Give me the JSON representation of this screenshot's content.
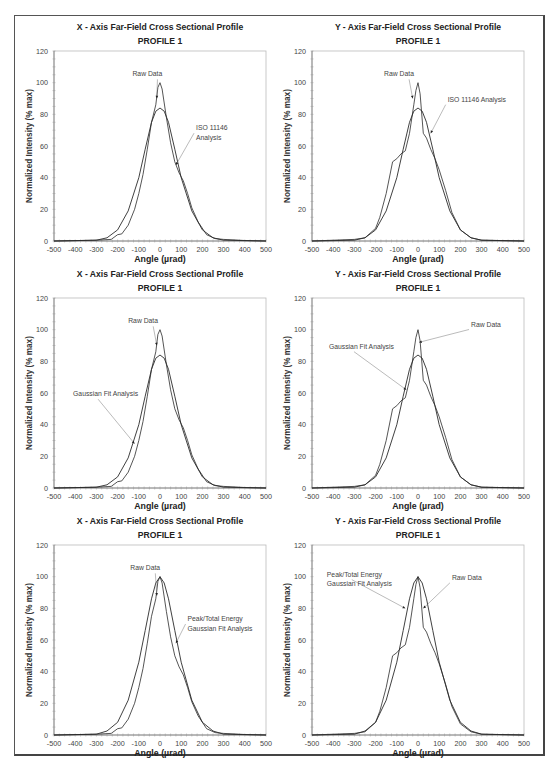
{
  "figure": {
    "panels_layout": "3 rows x 2 columns"
  },
  "chart_data": [
    {
      "id": "p1",
      "type": "line",
      "title": "X - Axis Far-Field Cross Sectional Profile",
      "subtitle": "PROFILE 1",
      "xlabel": "Angle (µrad)",
      "ylabel": "Normalized Intensity (% max)",
      "xlim": [
        -500,
        500
      ],
      "ylim": [
        0,
        120
      ],
      "xticks": [
        -500,
        -400,
        -300,
        -200,
        -100,
        0,
        100,
        200,
        300,
        400,
        500
      ],
      "yticks": [
        0,
        20,
        40,
        60,
        80,
        100,
        120
      ],
      "series": [
        {
          "name": "Raw Data",
          "x": [
            -500,
            -300,
            -230,
            -200,
            -180,
            -150,
            -120,
            -100,
            -80,
            -60,
            -40,
            -20,
            -10,
            0,
            10,
            30,
            50,
            70,
            90,
            110,
            130,
            150,
            180,
            220,
            260,
            300,
            400,
            500
          ],
          "y": [
            0,
            0.5,
            1,
            4,
            4.5,
            10,
            20,
            30,
            42,
            58,
            75,
            86,
            97,
            100,
            96,
            78,
            62,
            50,
            43,
            38,
            30,
            21,
            12,
            4,
            1.5,
            1,
            0.3,
            0
          ]
        },
        {
          "name": "ISO 11146 Analysis",
          "x": [
            -500,
            -300,
            -250,
            -200,
            -150,
            -100,
            -70,
            -40,
            -20,
            0,
            20,
            40,
            70,
            100,
            150,
            200,
            250,
            300,
            500
          ],
          "y": [
            0,
            0.5,
            2,
            7,
            19,
            40,
            58,
            75,
            82,
            84,
            82,
            75,
            58,
            40,
            19,
            7,
            2,
            0.5,
            0
          ]
        }
      ],
      "annotations": [
        {
          "text": "Raw Data",
          "x": -130,
          "y": 104,
          "arrow_to": [
            -15,
            90
          ]
        },
        {
          "text": "ISO 11146",
          "x": 170,
          "y": 70,
          "arrow_to": [
            75,
            48
          ]
        },
        {
          "text": "Analysis",
          "x": 170,
          "y": 64
        }
      ]
    },
    {
      "id": "p2",
      "type": "line",
      "title": "Y - Axis Far-Field Cross Sectional Profile",
      "subtitle": "PROFILE 1",
      "xlabel": "Angle (µrad)",
      "ylabel": "Normalized Intensity (% max)",
      "xlim": [
        -500,
        500
      ],
      "ylim": [
        0,
        120
      ],
      "xticks": [
        -500,
        -400,
        -300,
        -200,
        -100,
        0,
        100,
        200,
        300,
        400,
        500
      ],
      "yticks": [
        0,
        20,
        40,
        60,
        80,
        100,
        120
      ],
      "series": [
        {
          "name": "Raw Data",
          "x": [
            -500,
            -300,
            -250,
            -200,
            -180,
            -150,
            -120,
            -100,
            -80,
            -60,
            -40,
            -20,
            -10,
            0,
            10,
            25,
            40,
            60,
            80,
            100,
            130,
            160,
            200,
            250,
            300,
            500
          ],
          "y": [
            0,
            1,
            2,
            8,
            15,
            30,
            50,
            52,
            55,
            57,
            68,
            86,
            95,
            100,
            93,
            68,
            65,
            58,
            52,
            45,
            32,
            18,
            7,
            2,
            0.5,
            0
          ]
        },
        {
          "name": "ISO 11146 Analysis",
          "x": [
            -500,
            -300,
            -250,
            -200,
            -150,
            -100,
            -70,
            -40,
            -20,
            0,
            20,
            40,
            70,
            100,
            150,
            200,
            250,
            300,
            500
          ],
          "y": [
            0,
            0.5,
            2,
            7,
            19,
            40,
            58,
            75,
            82,
            84,
            82,
            75,
            58,
            40,
            19,
            7,
            2,
            0.5,
            0
          ]
        }
      ],
      "annotations": [
        {
          "text": "Raw Data",
          "x": -160,
          "y": 104,
          "arrow_to": [
            -25,
            90
          ]
        },
        {
          "text": "ISO 11146 Analysis",
          "x": 140,
          "y": 88,
          "arrow_to": [
            60,
            68
          ]
        }
      ]
    },
    {
      "id": "p3",
      "type": "line",
      "title": "X - Axis Far-Field Cross Sectional Profile",
      "subtitle": "PROFILE 1",
      "xlabel": "Angle (µrad)",
      "ylabel": "Normalized Intensity (% max)",
      "xlim": [
        -500,
        500
      ],
      "ylim": [
        0,
        120
      ],
      "xticks": [
        -500,
        -400,
        -300,
        -200,
        -100,
        0,
        100,
        200,
        300,
        400,
        500
      ],
      "yticks": [
        0,
        20,
        40,
        60,
        80,
        100,
        120
      ],
      "series": [
        {
          "name": "Raw Data",
          "x": [
            -500,
            -300,
            -230,
            -200,
            -180,
            -150,
            -120,
            -100,
            -80,
            -60,
            -40,
            -20,
            -10,
            0,
            10,
            30,
            50,
            70,
            90,
            110,
            130,
            150,
            180,
            220,
            260,
            300,
            400,
            500
          ],
          "y": [
            0,
            0.5,
            1,
            4,
            4.5,
            10,
            20,
            30,
            42,
            58,
            75,
            86,
            97,
            100,
            96,
            78,
            62,
            50,
            43,
            38,
            30,
            21,
            12,
            4,
            1.5,
            1,
            0.3,
            0
          ]
        },
        {
          "name": "Gaussian Fit Analysis",
          "x": [
            -500,
            -300,
            -250,
            -200,
            -150,
            -100,
            -70,
            -40,
            -20,
            0,
            20,
            40,
            70,
            100,
            150,
            200,
            250,
            300,
            500
          ],
          "y": [
            0,
            0.5,
            2,
            7,
            19,
            40,
            58,
            75,
            82,
            84,
            82,
            75,
            58,
            40,
            19,
            7,
            2,
            0.5,
            0
          ]
        }
      ],
      "annotations": [
        {
          "text": "Raw Data",
          "x": -150,
          "y": 104,
          "arrow_to": [
            -15,
            90
          ]
        },
        {
          "text": "Gaussian Fit Analysis",
          "x": -410,
          "y": 58,
          "arrow_to": [
            -120,
            28
          ]
        }
      ]
    },
    {
      "id": "p4",
      "type": "line",
      "title": "Y - Axis Far-Field Cross Sectional Profile",
      "subtitle": "PROFILE 1",
      "xlabel": "Angle (µrad)",
      "ylabel": "Normalized Intensity (% max)",
      "xlim": [
        -500,
        500
      ],
      "ylim": [
        0,
        120
      ],
      "xticks": [
        -500,
        -400,
        -300,
        -200,
        -100,
        0,
        100,
        200,
        300,
        400,
        500
      ],
      "yticks": [
        0,
        20,
        40,
        60,
        80,
        100,
        120
      ],
      "series": [
        {
          "name": "Raw Data",
          "x": [
            -500,
            -300,
            -250,
            -200,
            -180,
            -150,
            -120,
            -100,
            -80,
            -60,
            -40,
            -20,
            -10,
            0,
            10,
            25,
            40,
            60,
            80,
            100,
            130,
            160,
            200,
            250,
            300,
            500
          ],
          "y": [
            0,
            1,
            2,
            8,
            15,
            30,
            50,
            52,
            55,
            57,
            68,
            86,
            95,
            100,
            93,
            68,
            65,
            58,
            52,
            45,
            32,
            18,
            7,
            2,
            0.5,
            0
          ]
        },
        {
          "name": "Gaussian Fit Analysis",
          "x": [
            -500,
            -300,
            -250,
            -200,
            -150,
            -100,
            -70,
            -40,
            -20,
            0,
            20,
            40,
            70,
            100,
            150,
            200,
            250,
            300,
            500
          ],
          "y": [
            0,
            0.5,
            2,
            7,
            19,
            40,
            58,
            75,
            82,
            84,
            82,
            75,
            58,
            40,
            19,
            7,
            2,
            0.5,
            0
          ]
        }
      ],
      "annotations": [
        {
          "text": "Raw Data",
          "x": 250,
          "y": 102,
          "arrow_to": [
            5,
            92
          ]
        },
        {
          "text": "Gaussian Fit Analysis",
          "x": -420,
          "y": 88,
          "arrow_to": [
            -55,
            62
          ]
        }
      ]
    },
    {
      "id": "p5",
      "type": "line",
      "title": "X - Axis Far-Field Cross Sectional Profile",
      "subtitle": "PROFILE 1",
      "xlabel": "Angle (µrad)",
      "ylabel": "Normalized Intensity (% max)",
      "xlim": [
        -500,
        500
      ],
      "ylim": [
        0,
        120
      ],
      "xticks": [
        -500,
        -400,
        -300,
        -200,
        -100,
        0,
        100,
        200,
        300,
        400,
        500
      ],
      "yticks": [
        0,
        20,
        40,
        60,
        80,
        100,
        120
      ],
      "series": [
        {
          "name": "Raw Data",
          "x": [
            -500,
            -300,
            -230,
            -200,
            -180,
            -150,
            -120,
            -100,
            -80,
            -60,
            -40,
            -20,
            -10,
            0,
            10,
            30,
            50,
            70,
            90,
            110,
            130,
            150,
            180,
            220,
            260,
            300,
            400,
            500
          ],
          "y": [
            0,
            0.5,
            1,
            4,
            4.5,
            10,
            20,
            30,
            42,
            58,
            75,
            86,
            97,
            100,
            96,
            78,
            62,
            50,
            43,
            38,
            30,
            21,
            12,
            4,
            1.5,
            1,
            0.3,
            0
          ]
        },
        {
          "name": "Peak/Total Energy Gaussian Fit Analysis",
          "x": [
            -500,
            -300,
            -250,
            -200,
            -150,
            -100,
            -70,
            -40,
            -20,
            0,
            20,
            40,
            70,
            100,
            150,
            200,
            250,
            300,
            500
          ],
          "y": [
            0,
            0.5,
            2.5,
            8,
            22,
            46,
            66,
            86,
            96,
            100,
            96,
            86,
            66,
            46,
            22,
            8,
            2.5,
            0.5,
            0
          ]
        }
      ],
      "annotations": [
        {
          "text": "Raw Data",
          "x": -140,
          "y": 104,
          "arrow_to": [
            -15,
            88
          ]
        },
        {
          "text": "Peak/Total Energy",
          "x": 130,
          "y": 72,
          "arrow_to": [
            75,
            58
          ]
        },
        {
          "text": "Gaussian Fit Analysis",
          "x": 130,
          "y": 66
        }
      ]
    },
    {
      "id": "p6",
      "type": "line",
      "title": "Y - Axis Far-Field Cross Sectional Profile",
      "subtitle": "PROFILE 1",
      "xlabel": "Angle (µrad)",
      "ylabel": "Normalized Intensity (% max)",
      "xlim": [
        -500,
        500
      ],
      "ylim": [
        0,
        120
      ],
      "xticks": [
        -500,
        -400,
        -300,
        -200,
        -100,
        0,
        100,
        200,
        300,
        400,
        500
      ],
      "yticks": [
        0,
        20,
        40,
        60,
        80,
        100,
        120
      ],
      "series": [
        {
          "name": "Raw Data",
          "x": [
            -500,
            -300,
            -250,
            -200,
            -180,
            -150,
            -120,
            -100,
            -80,
            -60,
            -40,
            -20,
            -10,
            0,
            10,
            25,
            40,
            60,
            80,
            100,
            130,
            160,
            200,
            250,
            300,
            500
          ],
          "y": [
            0,
            1,
            2,
            8,
            15,
            30,
            50,
            52,
            55,
            57,
            68,
            86,
            95,
            100,
            93,
            68,
            65,
            58,
            52,
            45,
            32,
            18,
            7,
            2,
            0.5,
            0
          ]
        },
        {
          "name": "Peak/Total Energy Gaussian Fit Analysis",
          "x": [
            -500,
            -300,
            -250,
            -200,
            -150,
            -100,
            -70,
            -40,
            -20,
            0,
            20,
            40,
            70,
            100,
            150,
            200,
            250,
            300,
            500
          ],
          "y": [
            0,
            0.5,
            2.5,
            8,
            22,
            46,
            66,
            86,
            96,
            100,
            96,
            86,
            66,
            46,
            22,
            8,
            2.5,
            0.5,
            0
          ]
        }
      ],
      "annotations": [
        {
          "text": "Peak/Total Energy",
          "x": -430,
          "y": 100,
          "arrow_to": [
            -60,
            80
          ]
        },
        {
          "text": "Gaussian Fit Analysis",
          "x": -430,
          "y": 94
        },
        {
          "text": "Raw Data",
          "x": 160,
          "y": 98,
          "arrow_to": [
            25,
            80
          ]
        }
      ]
    }
  ]
}
